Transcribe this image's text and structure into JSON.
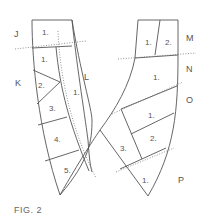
{
  "figure": {
    "caption": "FIG. 2",
    "side_labels": {
      "J": "J",
      "K": "K",
      "L": "L",
      "M": "M",
      "N": "N",
      "O": "O",
      "P": "P"
    },
    "left_piece": {
      "panels": [
        {
          "id": "J-1",
          "label": "1."
        },
        {
          "id": "K-1",
          "label": "1."
        },
        {
          "id": "K-2",
          "label": "2."
        },
        {
          "id": "K-3",
          "label": "3."
        },
        {
          "id": "K-4",
          "label": "4."
        },
        {
          "id": "K-5",
          "label": "5."
        },
        {
          "id": "L-1",
          "label": "1."
        }
      ]
    },
    "right_piece": {
      "panels": [
        {
          "id": "M-1",
          "label": "1."
        },
        {
          "id": "M-2",
          "label": "2."
        },
        {
          "id": "N-1",
          "label": "1."
        },
        {
          "id": "O-1",
          "label": "1."
        },
        {
          "id": "O-2",
          "label": "2."
        },
        {
          "id": "O-3",
          "label": "3."
        },
        {
          "id": "P-1",
          "label": "1."
        }
      ]
    },
    "colors": {
      "line": "#555555",
      "background": "#ffffff"
    }
  }
}
